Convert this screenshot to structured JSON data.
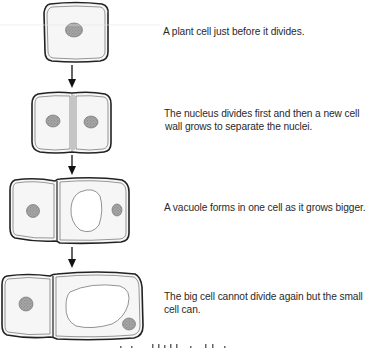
{
  "figure": {
    "stages": [
      {
        "id": "stage-1",
        "caption": "A plant cell just before it divides.",
        "description": "single cell with one nucleus"
      },
      {
        "id": "stage-2",
        "caption_line1": "The nucleus divides first and then a new cell",
        "caption_line2": "wall grows to separate the nuclei.",
        "description": "two cells side by side, each with a nucleus"
      },
      {
        "id": "stage-3",
        "caption": "A vacuole forms in one cell as it grows bigger.",
        "description": "small left cell and larger right cell containing a vacuole"
      },
      {
        "id": "stage-4",
        "caption_line1": "The big cell cannot divide again but the small",
        "caption_line2": "cell can.",
        "description": "small left cell and big right cell with large vacuole"
      }
    ],
    "arrows": [
      {
        "from": "stage-1",
        "to": "stage-2"
      },
      {
        "from": "stage-2",
        "to": "stage-3"
      },
      {
        "from": "stage-3",
        "to": "stage-4"
      }
    ],
    "footer_clipped_text": "",
    "colors": {
      "cell_fill": "#f6f6f6",
      "cell_outline": "#222222",
      "nucleus": "#999999",
      "vacuole": "#ffffff",
      "text": "#2a2a2a"
    }
  }
}
